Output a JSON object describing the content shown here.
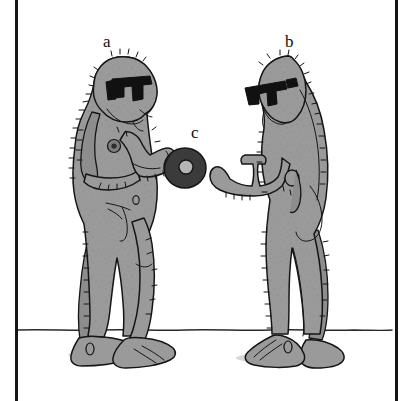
{
  "figure": {
    "caption_labels": [
      {
        "id": "a",
        "text": "a",
        "refers_to": "left-hominid-figure"
      },
      {
        "id": "b",
        "text": "b",
        "refers_to": "right-hominid-figure"
      },
      {
        "id": "c",
        "text": "c",
        "refers_to": "dark-ring-object"
      }
    ],
    "background_color": "#ffffff",
    "ink_color": "#151515",
    "body_fill_color": "#9a9a9a",
    "body_shade_color": "#8d8d8d",
    "object_fill_color": "#3b3b3b",
    "glasses_color": "#111111",
    "ground_line_color": "#2a2a2a",
    "scene_description": "Two shaggy hominid figures facing each other, both wearing heavy black-framed sunglasses; the left figure holds out a dark ring-shaped object toward the right figure's open hand.",
    "panel": {
      "left_rule_x": 15,
      "right_rule_x": 395,
      "rule_width": 3
    },
    "ground": {
      "y": 330,
      "x_start": 18,
      "x_end": 392
    }
  }
}
